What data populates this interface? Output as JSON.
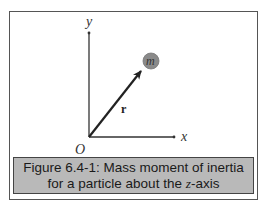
{
  "diagram": {
    "y_axis_label": "y",
    "x_axis_label": "x",
    "origin_label": "O",
    "vector_label": "r",
    "particle_label": "m",
    "colors": {
      "axis": "#333333",
      "vector": "#222222",
      "particle_fill": "#8a8a8a",
      "caption_bg": "#b9b9b9"
    }
  },
  "caption": {
    "line1": "Figure 6.4-1: Mass moment of inertia",
    "line2_prefix": "for a particle about the ",
    "line2_italic": "z",
    "line2_suffix": "-axis"
  }
}
